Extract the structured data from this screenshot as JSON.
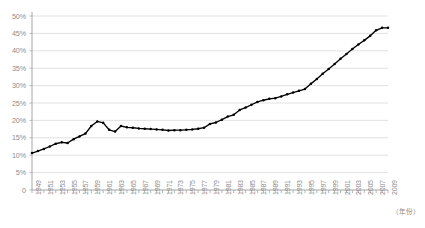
{
  "chart_data": {
    "type": "line",
    "title": "",
    "subtitle": "",
    "xlabel": "（年份）",
    "ylabel": "",
    "xlim": [
      1949,
      2009
    ],
    "ylim": [
      0,
      50
    ],
    "ytick_values": [
      0,
      5,
      10,
      15,
      20,
      25,
      30,
      35,
      40,
      45,
      50
    ],
    "ytick_labels": [
      "0",
      "5%",
      "10%",
      "15%",
      "20%",
      "25%",
      "30%",
      "35%",
      "40%",
      "45%",
      "50%"
    ],
    "xtick_labels": [
      "1949",
      "1951",
      "1953",
      "1955",
      "1957",
      "1959",
      "1961",
      "1963",
      "1965",
      "1967",
      "1969",
      "1971",
      "1973",
      "1975",
      "1977",
      "1979",
      "1981",
      "1983",
      "1985",
      "1987",
      "1989",
      "1991",
      "1993",
      "1995",
      "1997",
      "1999",
      "2001",
      "2003",
      "2005",
      "2007",
      "2009"
    ],
    "xtick_step_years": 2,
    "grid": "horizontal",
    "legend": "none",
    "marker": "small-filled-circle",
    "line_color": "#000000",
    "grid_color": "#d9d9d9",
    "axis_color": "#a6a6a6",
    "series": [
      {
        "name": "urbanization-rate",
        "x": [
          1949,
          1950,
          1951,
          1952,
          1953,
          1954,
          1955,
          1956,
          1957,
          1958,
          1959,
          1960,
          1961,
          1962,
          1963,
          1964,
          1965,
          1966,
          1967,
          1968,
          1969,
          1970,
          1971,
          1972,
          1973,
          1974,
          1975,
          1976,
          1977,
          1978,
          1979,
          1980,
          1981,
          1982,
          1983,
          1984,
          1985,
          1986,
          1987,
          1988,
          1989,
          1990,
          1991,
          1992,
          1993,
          1994,
          1995,
          1996,
          1997,
          1998,
          1999,
          2000,
          2001,
          2002,
          2003,
          2004,
          2005,
          2006,
          2007,
          2008,
          2009
        ],
        "values": [
          10.6,
          11.2,
          11.8,
          12.5,
          13.3,
          13.7,
          13.5,
          14.6,
          15.4,
          16.2,
          18.4,
          19.7,
          19.3,
          17.3,
          16.8,
          18.4,
          18.0,
          17.9,
          17.7,
          17.6,
          17.5,
          17.4,
          17.3,
          17.1,
          17.2,
          17.2,
          17.3,
          17.4,
          17.6,
          17.9,
          19.0,
          19.4,
          20.2,
          21.1,
          21.6,
          23.0,
          23.7,
          24.5,
          25.3,
          25.8,
          26.2,
          26.4,
          26.9,
          27.5,
          28.0,
          28.5,
          29.0,
          30.5,
          31.9,
          33.4,
          34.8,
          36.2,
          37.7,
          39.1,
          40.5,
          41.8,
          43.0,
          44.3,
          45.9,
          46.6,
          46.6
        ]
      }
    ]
  }
}
